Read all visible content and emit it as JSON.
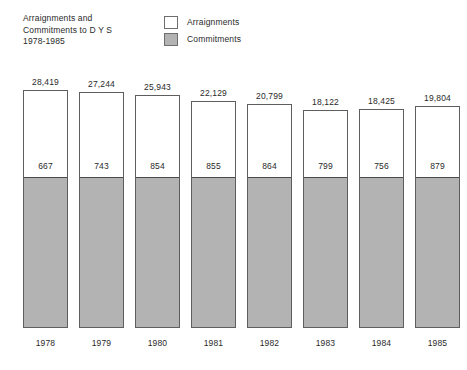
{
  "title": {
    "text": "Arraignments and\nCommitments to D Y S\n1978-1985"
  },
  "legend": {
    "items": [
      {
        "label": "Arraignments",
        "swatch": "white-swatch-icon",
        "color": "#ffffff"
      },
      {
        "label": "Commitments",
        "swatch": "gray-swatch-icon",
        "color": "#b3b3b3"
      }
    ]
  },
  "chart_data": {
    "type": "bar",
    "title": "Arraignments and Commitments to D Y S 1978-1985",
    "xlabel": "",
    "ylabel": "",
    "grid": false,
    "legend_position": "top-center",
    "ylim": [
      0,
      28419
    ],
    "stacked": true,
    "categories": [
      "1978",
      "1979",
      "1980",
      "1981",
      "1982",
      "1983",
      "1984",
      "1985"
    ],
    "series": [
      {
        "name": "Arraignments",
        "color": "#ffffff",
        "note": "total arraignments, label shown above each bar",
        "values": [
          28419,
          27244,
          25943,
          22129,
          20799,
          18122,
          18425,
          19804
        ],
        "value_labels": [
          "28,419",
          "27,244",
          "25,943",
          "22,129",
          "20,799",
          "18,122",
          "18,425",
          "19,804"
        ]
      },
      {
        "name": "Commitments",
        "color": "#b3b3b3",
        "note": "commitments, label shown inside each bar above the gray block",
        "values": [
          667,
          743,
          854,
          855,
          864,
          799,
          756,
          879
        ],
        "value_labels": [
          "667",
          "743",
          "854",
          "855",
          "864",
          "799",
          "756",
          "879"
        ]
      }
    ]
  },
  "layout": {
    "bars": [
      {
        "x": 23,
        "top": 90,
        "boundary": 178,
        "bottom": 328
      },
      {
        "x": 79,
        "top": 92,
        "boundary": 178,
        "bottom": 328
      },
      {
        "x": 135,
        "top": 95,
        "boundary": 178,
        "bottom": 328
      },
      {
        "x": 191,
        "top": 101,
        "boundary": 178,
        "bottom": 328
      },
      {
        "x": 247,
        "top": 104,
        "boundary": 178,
        "bottom": 328
      },
      {
        "x": 303,
        "top": 110,
        "boundary": 178,
        "bottom": 328
      },
      {
        "x": 359,
        "top": 109,
        "boundary": 178,
        "bottom": 328
      },
      {
        "x": 415,
        "top": 106,
        "boundary": 178,
        "bottom": 328
      }
    ],
    "total_label_offset": 13,
    "commit_label_offset": 17,
    "year_label_y": 338
  }
}
